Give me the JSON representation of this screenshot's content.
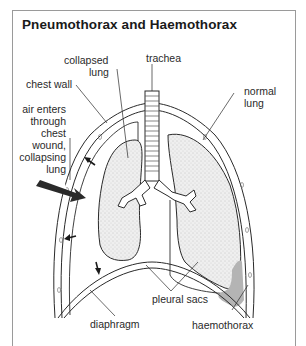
{
  "title": "Pneumothorax and Haemothorax",
  "labels": {
    "collapsed_lung_1": "collapsed",
    "collapsed_lung_2": "lung",
    "trachea": "trachea",
    "chest_wall": "chest wall",
    "normal_lung_1": "normal",
    "normal_lung_2": "lung",
    "air_enters_1": "air enters",
    "air_enters_2": "through",
    "air_enters_3": "chest",
    "air_enters_4": "wound,",
    "air_enters_5": "collapsing",
    "air_enters_6": "lung",
    "pleural_sacs": "pleural sacs",
    "diaphragm": "diaphragm",
    "haemothorax": "haemothorax"
  },
  "colors": {
    "line": "#2a2a2a",
    "lung_fill": "#ececec",
    "blood_fill": "#b4b4b4",
    "frame": "#9a9a9a"
  }
}
